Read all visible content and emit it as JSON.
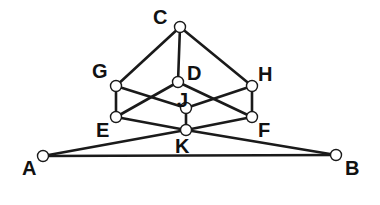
{
  "diagram": {
    "type": "graph",
    "colors": {
      "edge": "#1a1a1a",
      "node_fill": "#ffffff",
      "label": "#111111",
      "background": "#ffffff"
    },
    "nodes": [
      {
        "id": "C",
        "label": "C",
        "x": 180,
        "y": 27,
        "lx": 153,
        "ly": 24
      },
      {
        "id": "G",
        "label": "G",
        "x": 116,
        "y": 86,
        "lx": 92,
        "ly": 78
      },
      {
        "id": "D",
        "label": "D",
        "x": 178,
        "y": 82,
        "lx": 187,
        "ly": 80
      },
      {
        "id": "H",
        "label": "H",
        "x": 252,
        "y": 86,
        "lx": 258,
        "ly": 81
      },
      {
        "id": "J",
        "label": "J",
        "x": 186,
        "y": 108,
        "lx": 177,
        "ly": 107
      },
      {
        "id": "E",
        "label": "E",
        "x": 116,
        "y": 117,
        "lx": 96,
        "ly": 137
      },
      {
        "id": "F",
        "label": "F",
        "x": 252,
        "y": 117,
        "lx": 258,
        "ly": 137
      },
      {
        "id": "K",
        "label": "K",
        "x": 186,
        "y": 130,
        "lx": 175,
        "ly": 153
      },
      {
        "id": "A",
        "label": "A",
        "x": 43,
        "y": 156,
        "lx": 22,
        "ly": 175
      },
      {
        "id": "B",
        "label": "B",
        "x": 336,
        "y": 155,
        "lx": 345,
        "ly": 175
      }
    ],
    "edges": [
      [
        "C",
        "G"
      ],
      [
        "C",
        "D"
      ],
      [
        "C",
        "H"
      ],
      [
        "G",
        "E"
      ],
      [
        "H",
        "F"
      ],
      [
        "G",
        "J"
      ],
      [
        "H",
        "J"
      ],
      [
        "D",
        "E"
      ],
      [
        "D",
        "F"
      ],
      [
        "J",
        "K"
      ],
      [
        "E",
        "K"
      ],
      [
        "F",
        "K"
      ],
      [
        "K",
        "A"
      ],
      [
        "K",
        "B"
      ],
      [
        "A",
        "B"
      ]
    ]
  }
}
